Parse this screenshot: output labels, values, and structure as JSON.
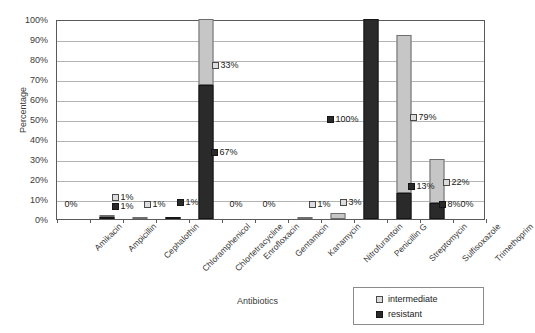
{
  "chart_data": {
    "type": "bar",
    "subtype": "stacked-column",
    "title": "",
    "xlabel": "Antibiotics",
    "ylabel": "Percentage",
    "ylim": [
      0,
      100
    ],
    "ytick_labels": [
      "100%",
      "90%",
      "80%",
      "70%",
      "60%",
      "50%",
      "40%",
      "30%",
      "20%",
      "10%",
      "0%"
    ],
    "ytick_values": [
      100,
      90,
      80,
      70,
      60,
      50,
      40,
      30,
      20,
      10,
      0
    ],
    "grid": true,
    "legend_position": "bottom-right",
    "categories": [
      "Amikacin",
      "Ampicillin",
      "Cephalothin",
      "Chloramphenicol",
      "Chlortetracycline",
      "Enrofloxacin",
      "Gentamicin",
      "Kanamycin",
      "Nitrofurantoin",
      "Penicillin G",
      "Streptomycin",
      "Sulfisoxazole",
      "Trimethoprim"
    ],
    "series": [
      {
        "name": "resistant",
        "color": "#2a2a2a",
        "values": [
          0,
          1,
          0,
          1,
          67,
          0,
          0,
          0,
          0,
          100,
          13,
          8,
          0
        ]
      },
      {
        "name": "intermediate",
        "color": "#c6c6c6",
        "values": [
          0,
          1,
          1,
          0,
          33,
          0,
          0,
          1,
          3,
          0,
          79,
          22,
          0
        ]
      }
    ],
    "annotations": [
      {
        "category": "Amikacin",
        "series": "none",
        "text": "0%"
      },
      {
        "category": "Ampicillin",
        "series": "intermediate",
        "text": "1%"
      },
      {
        "category": "Ampicillin",
        "series": "resistant",
        "text": "1%"
      },
      {
        "category": "Cephalothin",
        "series": "intermediate",
        "text": "1%"
      },
      {
        "category": "Chloramphenicol",
        "series": "resistant",
        "text": "1%"
      },
      {
        "category": "Chlortetracycline",
        "series": "intermediate",
        "text": "33%"
      },
      {
        "category": "Chlortetracycline",
        "series": "resistant",
        "text": "67%"
      },
      {
        "category": "Enrofloxacin",
        "series": "none",
        "text": "0%"
      },
      {
        "category": "Gentamicin",
        "series": "none",
        "text": "0%"
      },
      {
        "category": "Kanamycin",
        "series": "intermediate",
        "text": "1%"
      },
      {
        "category": "Nitrofurantoin",
        "series": "intermediate",
        "text": "3%"
      },
      {
        "category": "Penicillin G",
        "series": "resistant",
        "text": "100%"
      },
      {
        "category": "Streptomycin",
        "series": "intermediate",
        "text": "79%"
      },
      {
        "category": "Streptomycin",
        "series": "resistant",
        "text": "13%"
      },
      {
        "category": "Sulfisoxazole",
        "series": "intermediate",
        "text": "22%"
      },
      {
        "category": "Sulfisoxazole",
        "series": "resistant",
        "text": "8%"
      },
      {
        "category": "Trimethoprim",
        "series": "none",
        "text": "0%"
      }
    ]
  },
  "axes": {
    "y_title": "Percentage",
    "x_title": "Antibiotics"
  },
  "legend": {
    "items": [
      {
        "label": "intermediate",
        "swatch": "intermediate-swatch"
      },
      {
        "label": "resistant",
        "swatch": "resistant-swatch"
      }
    ]
  }
}
